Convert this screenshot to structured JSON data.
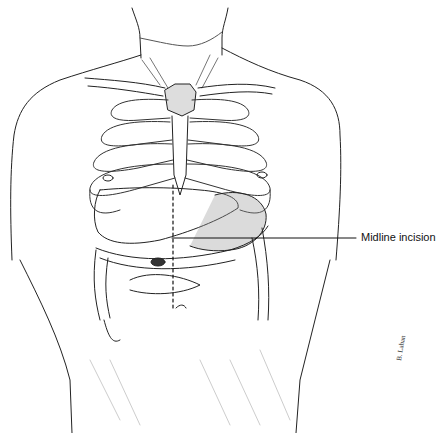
{
  "figure": {
    "callout": {
      "label": "Midline incision"
    },
    "signature": "B. Lahan"
  }
}
